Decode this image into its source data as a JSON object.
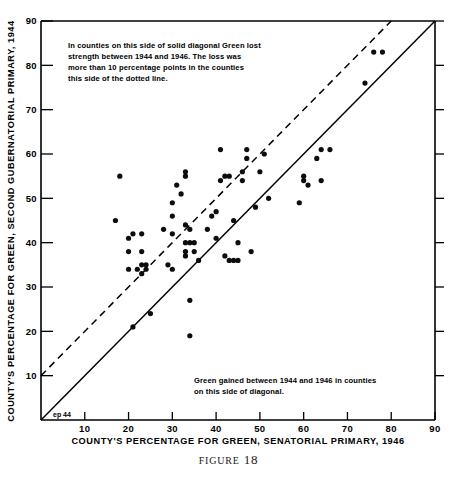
{
  "figure": {
    "caption_word": "FIGURE",
    "caption_number": "18",
    "corner_mark": "ep 44",
    "page_bleed": ""
  },
  "chart_data": {
    "type": "scatter",
    "title": "",
    "xlabel": "COUNTY'S PERCENTAGE FOR GREEN, SENATORIAL PRIMARY, 1946",
    "ylabel": "COUNTY'S PERCENTAGE FOR GREEN, SECOND GUBERNATORIAL PRIMARY, 1944",
    "xlim": [
      0,
      90
    ],
    "ylim": [
      0,
      90
    ],
    "xticks": [
      10,
      20,
      30,
      40,
      50,
      60,
      70,
      80,
      90
    ],
    "xtick_labels": [
      "10",
      "20",
      "30",
      "40",
      "50",
      "60",
      "70",
      "80",
      "90"
    ],
    "yticks": [
      10,
      20,
      30,
      40,
      50,
      60,
      70,
      80,
      90
    ],
    "ytick_labels": [
      "10",
      "20",
      "30",
      "40",
      "50",
      "60",
      "70",
      "80",
      "90"
    ],
    "grid": false,
    "legend": "none",
    "marker": "filled-circle",
    "marker_color": "#0d0d0d",
    "marker_radius": 2.6,
    "points": [
      [
        17,
        45
      ],
      [
        18,
        55
      ],
      [
        20,
        41
      ],
      [
        20,
        38
      ],
      [
        20,
        34
      ],
      [
        21,
        42
      ],
      [
        21,
        21
      ],
      [
        22,
        34
      ],
      [
        23,
        42
      ],
      [
        23,
        38
      ],
      [
        23,
        35
      ],
      [
        23,
        33
      ],
      [
        24,
        35
      ],
      [
        24,
        34
      ],
      [
        25,
        24
      ],
      [
        28,
        43
      ],
      [
        29,
        35
      ],
      [
        30,
        46
      ],
      [
        30,
        49
      ],
      [
        30,
        42
      ],
      [
        30,
        34
      ],
      [
        31,
        53
      ],
      [
        32,
        51
      ],
      [
        33,
        56
      ],
      [
        33,
        55
      ],
      [
        33,
        40
      ],
      [
        33,
        38
      ],
      [
        33,
        44
      ],
      [
        33,
        37
      ],
      [
        34,
        43
      ],
      [
        34,
        40
      ],
      [
        34,
        27
      ],
      [
        34,
        19
      ],
      [
        35,
        40
      ],
      [
        35,
        38
      ],
      [
        36,
        36
      ],
      [
        38,
        43
      ],
      [
        39,
        46
      ],
      [
        40,
        47
      ],
      [
        40,
        41
      ],
      [
        41,
        61
      ],
      [
        41,
        54
      ],
      [
        42,
        55
      ],
      [
        42,
        37
      ],
      [
        43,
        55
      ],
      [
        43,
        36
      ],
      [
        44,
        45
      ],
      [
        44,
        36
      ],
      [
        45,
        40
      ],
      [
        45,
        36
      ],
      [
        46,
        54
      ],
      [
        46,
        56
      ],
      [
        47,
        59
      ],
      [
        47,
        61
      ],
      [
        48,
        38
      ],
      [
        49,
        48
      ],
      [
        50,
        56
      ],
      [
        51,
        60
      ],
      [
        52,
        50
      ],
      [
        59,
        49
      ],
      [
        60,
        54
      ],
      [
        60,
        55
      ],
      [
        61,
        53
      ],
      [
        63,
        59
      ],
      [
        64,
        54
      ],
      [
        64,
        61
      ],
      [
        66,
        61
      ],
      [
        74,
        76
      ],
      [
        76,
        83
      ],
      [
        78,
        83
      ]
    ],
    "reference_lines": [
      {
        "name": "no-change-diagonal",
        "style": "solid",
        "equation": "y = x",
        "from": [
          0,
          0
        ],
        "to": [
          90,
          90
        ]
      },
      {
        "name": "ten-point-loss-diagonal",
        "style": "dashed",
        "equation": "y = x + 10",
        "from": [
          0,
          10
        ],
        "to": [
          80,
          90
        ]
      }
    ],
    "annotations": [
      {
        "name": "upper-left-note",
        "lines": [
          "In counties on this side of solid diagonal Green lost",
          "strength between 1944 and 1946. The loss was",
          "more  than 10 percentage points in the counties",
          "this side of the dotted line."
        ]
      },
      {
        "name": "lower-right-note",
        "lines": [
          "Green gained between 1944 and 1946 in counties",
          "on this side of diagonal."
        ]
      }
    ]
  }
}
